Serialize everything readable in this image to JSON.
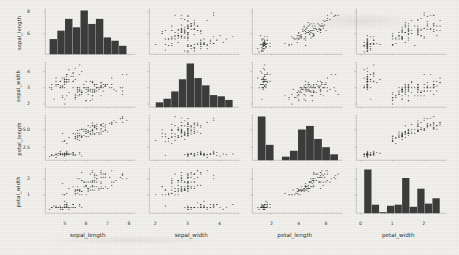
{
  "figure": {
    "kind": "scatter-plot-matrix",
    "background_color": "#f3f2ef",
    "mark_color": "#3d3d3d",
    "axis_color": "#8a8a8a"
  },
  "chart_data": {
    "type": "scatter",
    "title": "",
    "subtitle": "",
    "matrix": true,
    "grid": false,
    "legend": "none",
    "diagonal": "histogram",
    "variables": [
      "sepal_length",
      "sepal_width",
      "petal_length",
      "petal_width"
    ],
    "axis_labels": {
      "x": [
        "sepal_length",
        "sepal_width",
        "petal_length",
        "petal_width"
      ],
      "y": [
        "sepal_length",
        "sepal_width",
        "petal_length",
        "petal_width"
      ]
    },
    "x_ticks": [
      [
        "5",
        "6",
        "7",
        "8"
      ],
      [
        "2",
        "3",
        "4"
      ],
      [
        "2",
        "4",
        "6"
      ],
      [
        "0",
        "1",
        "2"
      ]
    ],
    "y_ticks": [
      [
        "8",
        "6"
      ],
      [
        "4",
        "3",
        "2"
      ],
      [
        "5.0",
        "2.5"
      ],
      [
        "2",
        "1"
      ]
    ],
    "axis_ranges": {
      "sepal_length": [
        4.1,
        8.3
      ],
      "sepal_width": [
        1.8,
        4.6
      ],
      "petal_length": [
        0.6,
        7.2
      ],
      "petal_width": [
        -0.15,
        2.7
      ]
    },
    "histograms": {
      "sepal_length": {
        "bin_edges": [
          4.3,
          4.66,
          5.02,
          5.38,
          5.74,
          6.1,
          6.46,
          6.82,
          7.18,
          7.54,
          7.9
        ],
        "counts": [
          9,
          14,
          21,
          16,
          26,
          18,
          21,
          10,
          8,
          5
        ]
      },
      "sepal_width": {
        "bin_edges": [
          2.0,
          2.24,
          2.48,
          2.72,
          2.96,
          3.2,
          3.44,
          3.68,
          3.92,
          4.16,
          4.4
        ],
        "counts": [
          4,
          7,
          13,
          23,
          36,
          24,
          18,
          10,
          9,
          6
        ]
      },
      "petal_length": {
        "bin_edges": [
          1.0,
          1.59,
          2.18,
          2.77,
          3.36,
          3.95,
          4.54,
          5.13,
          5.72,
          6.31,
          6.9
        ],
        "counts": [
          37,
          13,
          0,
          3,
          8,
          26,
          29,
          18,
          11,
          5
        ]
      },
      "petal_width": {
        "bin_edges": [
          0.1,
          0.34,
          0.58,
          0.82,
          1.06,
          1.3,
          1.54,
          1.78,
          2.02,
          2.26,
          2.5
        ],
        "counts": [
          41,
          8,
          1,
          7,
          8,
          33,
          6,
          23,
          9,
          14
        ]
      }
    },
    "series": [
      {
        "name": "iris",
        "points": [
          [
            5.1,
            3.5,
            1.4,
            0.2
          ],
          [
            4.9,
            3.0,
            1.4,
            0.2
          ],
          [
            4.7,
            3.2,
            1.3,
            0.2
          ],
          [
            4.6,
            3.1,
            1.5,
            0.2
          ],
          [
            5.0,
            3.6,
            1.4,
            0.2
          ],
          [
            5.4,
            3.9,
            1.7,
            0.4
          ],
          [
            4.6,
            3.4,
            1.4,
            0.3
          ],
          [
            5.0,
            3.4,
            1.5,
            0.2
          ],
          [
            4.4,
            2.9,
            1.4,
            0.2
          ],
          [
            4.9,
            3.1,
            1.5,
            0.1
          ],
          [
            5.4,
            3.7,
            1.5,
            0.2
          ],
          [
            4.8,
            3.4,
            1.6,
            0.2
          ],
          [
            4.8,
            3.0,
            1.4,
            0.1
          ],
          [
            4.3,
            3.0,
            1.1,
            0.1
          ],
          [
            5.8,
            4.0,
            1.2,
            0.2
          ],
          [
            5.7,
            4.4,
            1.5,
            0.4
          ],
          [
            5.4,
            3.9,
            1.3,
            0.4
          ],
          [
            5.1,
            3.5,
            1.4,
            0.3
          ],
          [
            5.7,
            3.8,
            1.7,
            0.3
          ],
          [
            5.1,
            3.8,
            1.5,
            0.3
          ],
          [
            5.4,
            3.4,
            1.7,
            0.2
          ],
          [
            5.1,
            3.7,
            1.5,
            0.4
          ],
          [
            4.6,
            3.6,
            1.0,
            0.2
          ],
          [
            5.1,
            3.3,
            1.7,
            0.5
          ],
          [
            4.8,
            3.4,
            1.9,
            0.2
          ],
          [
            5.0,
            3.0,
            1.6,
            0.2
          ],
          [
            5.0,
            3.4,
            1.6,
            0.4
          ],
          [
            5.2,
            3.5,
            1.5,
            0.2
          ],
          [
            5.2,
            3.4,
            1.4,
            0.2
          ],
          [
            4.7,
            3.2,
            1.6,
            0.2
          ],
          [
            4.8,
            3.1,
            1.6,
            0.2
          ],
          [
            5.4,
            3.4,
            1.5,
            0.4
          ],
          [
            5.2,
            4.1,
            1.5,
            0.1
          ],
          [
            5.5,
            4.2,
            1.4,
            0.2
          ],
          [
            4.9,
            3.1,
            1.5,
            0.2
          ],
          [
            5.0,
            3.2,
            1.2,
            0.2
          ],
          [
            5.5,
            3.5,
            1.3,
            0.2
          ],
          [
            4.9,
            3.6,
            1.4,
            0.1
          ],
          [
            4.4,
            3.0,
            1.3,
            0.2
          ],
          [
            5.1,
            3.4,
            1.5,
            0.2
          ],
          [
            5.0,
            3.5,
            1.3,
            0.3
          ],
          [
            4.5,
            2.3,
            1.3,
            0.3
          ],
          [
            4.4,
            3.2,
            1.3,
            0.2
          ],
          [
            5.0,
            3.5,
            1.6,
            0.6
          ],
          [
            5.1,
            3.8,
            1.9,
            0.4
          ],
          [
            4.8,
            3.0,
            1.4,
            0.3
          ],
          [
            5.1,
            3.8,
            1.6,
            0.2
          ],
          [
            4.6,
            3.2,
            1.4,
            0.2
          ],
          [
            5.3,
            3.7,
            1.5,
            0.2
          ],
          [
            5.0,
            3.3,
            1.4,
            0.2
          ],
          [
            7.0,
            3.2,
            4.7,
            1.4
          ],
          [
            6.4,
            3.2,
            4.5,
            1.5
          ],
          [
            6.9,
            3.1,
            4.9,
            1.5
          ],
          [
            5.5,
            2.3,
            4.0,
            1.3
          ],
          [
            6.5,
            2.8,
            4.6,
            1.5
          ],
          [
            5.7,
            2.8,
            4.5,
            1.3
          ],
          [
            6.3,
            3.3,
            4.7,
            1.6
          ],
          [
            4.9,
            2.4,
            3.3,
            1.0
          ],
          [
            6.6,
            2.9,
            4.6,
            1.3
          ],
          [
            5.2,
            2.7,
            3.9,
            1.4
          ],
          [
            5.0,
            2.0,
            3.5,
            1.0
          ],
          [
            5.9,
            3.0,
            4.2,
            1.5
          ],
          [
            6.0,
            2.2,
            4.0,
            1.0
          ],
          [
            6.1,
            2.9,
            4.7,
            1.4
          ],
          [
            5.6,
            2.9,
            3.6,
            1.3
          ],
          [
            6.7,
            3.1,
            4.4,
            1.4
          ],
          [
            5.6,
            3.0,
            4.5,
            1.5
          ],
          [
            5.8,
            2.7,
            4.1,
            1.0
          ],
          [
            6.2,
            2.2,
            4.5,
            1.5
          ],
          [
            5.6,
            2.5,
            3.9,
            1.1
          ],
          [
            5.9,
            3.2,
            4.8,
            1.8
          ],
          [
            6.1,
            2.8,
            4.0,
            1.3
          ],
          [
            6.3,
            2.5,
            4.9,
            1.5
          ],
          [
            6.1,
            2.8,
            4.7,
            1.2
          ],
          [
            6.4,
            2.9,
            4.3,
            1.3
          ],
          [
            6.6,
            3.0,
            4.4,
            1.4
          ],
          [
            6.8,
            2.8,
            4.8,
            1.4
          ],
          [
            6.7,
            3.0,
            5.0,
            1.7
          ],
          [
            6.0,
            2.9,
            4.5,
            1.5
          ],
          [
            5.7,
            2.6,
            3.5,
            1.0
          ],
          [
            5.5,
            2.4,
            3.8,
            1.1
          ],
          [
            5.5,
            2.4,
            3.7,
            1.0
          ],
          [
            5.8,
            2.7,
            3.9,
            1.2
          ],
          [
            6.0,
            2.7,
            5.1,
            1.6
          ],
          [
            5.4,
            3.0,
            4.5,
            1.5
          ],
          [
            6.0,
            3.4,
            4.5,
            1.6
          ],
          [
            6.7,
            3.1,
            4.7,
            1.5
          ],
          [
            6.3,
            2.3,
            4.4,
            1.3
          ],
          [
            5.6,
            3.0,
            4.1,
            1.3
          ],
          [
            5.5,
            2.5,
            4.0,
            1.3
          ],
          [
            5.5,
            2.6,
            4.4,
            1.2
          ],
          [
            6.1,
            3.0,
            4.6,
            1.4
          ],
          [
            5.8,
            2.6,
            4.0,
            1.2
          ],
          [
            5.0,
            2.3,
            3.3,
            1.0
          ],
          [
            5.6,
            2.7,
            4.2,
            1.3
          ],
          [
            5.7,
            3.0,
            4.2,
            1.2
          ],
          [
            5.7,
            2.9,
            4.2,
            1.3
          ],
          [
            6.2,
            2.9,
            4.3,
            1.3
          ],
          [
            5.1,
            2.5,
            3.0,
            1.1
          ],
          [
            5.7,
            2.8,
            4.1,
            1.3
          ],
          [
            6.3,
            3.3,
            6.0,
            2.5
          ],
          [
            5.8,
            2.7,
            5.1,
            1.9
          ],
          [
            7.1,
            3.0,
            5.9,
            2.1
          ],
          [
            6.3,
            2.9,
            5.6,
            1.8
          ],
          [
            6.5,
            3.0,
            5.8,
            2.2
          ],
          [
            7.6,
            3.0,
            6.6,
            2.1
          ],
          [
            4.9,
            2.5,
            4.5,
            1.7
          ],
          [
            7.3,
            2.9,
            6.3,
            1.8
          ],
          [
            6.7,
            2.5,
            5.8,
            1.8
          ],
          [
            7.2,
            3.6,
            6.1,
            2.5
          ],
          [
            6.5,
            3.2,
            5.1,
            2.0
          ],
          [
            6.4,
            2.7,
            5.3,
            1.9
          ],
          [
            6.8,
            3.0,
            5.5,
            2.1
          ],
          [
            5.7,
            2.5,
            5.0,
            2.0
          ],
          [
            5.8,
            2.8,
            5.1,
            2.4
          ],
          [
            6.4,
            3.2,
            5.3,
            2.3
          ],
          [
            6.5,
            3.0,
            5.5,
            1.8
          ],
          [
            7.7,
            3.8,
            6.7,
            2.2
          ],
          [
            7.7,
            2.6,
            6.9,
            2.3
          ],
          [
            6.0,
            2.2,
            5.0,
            1.5
          ],
          [
            6.9,
            3.2,
            5.7,
            2.3
          ],
          [
            5.6,
            2.8,
            4.9,
            2.0
          ],
          [
            7.7,
            2.8,
            6.7,
            2.0
          ],
          [
            6.3,
            2.7,
            4.9,
            1.8
          ],
          [
            6.7,
            3.3,
            5.7,
            2.1
          ],
          [
            7.2,
            3.2,
            6.0,
            1.8
          ],
          [
            6.2,
            2.8,
            4.8,
            1.8
          ],
          [
            6.1,
            3.0,
            4.9,
            1.8
          ],
          [
            6.4,
            2.8,
            5.6,
            2.1
          ],
          [
            7.2,
            3.0,
            5.8,
            1.6
          ],
          [
            7.4,
            2.8,
            6.1,
            1.9
          ],
          [
            7.9,
            3.8,
            6.4,
            2.0
          ],
          [
            6.4,
            2.8,
            5.6,
            2.2
          ],
          [
            6.3,
            2.8,
            5.1,
            1.5
          ],
          [
            6.1,
            2.6,
            5.6,
            1.4
          ],
          [
            7.7,
            3.0,
            6.1,
            2.3
          ],
          [
            6.3,
            3.4,
            5.6,
            2.4
          ],
          [
            6.4,
            3.1,
            5.5,
            1.8
          ],
          [
            6.0,
            3.0,
            4.8,
            1.8
          ],
          [
            6.9,
            3.1,
            5.4,
            2.1
          ],
          [
            6.7,
            3.1,
            5.6,
            2.4
          ],
          [
            6.9,
            3.1,
            5.1,
            2.3
          ],
          [
            5.8,
            2.7,
            5.1,
            1.9
          ],
          [
            6.8,
            3.2,
            5.9,
            2.3
          ],
          [
            6.7,
            3.3,
            5.7,
            2.5
          ],
          [
            6.7,
            3.0,
            5.2,
            2.3
          ],
          [
            6.3,
            2.5,
            5.0,
            1.9
          ],
          [
            6.5,
            3.0,
            5.2,
            2.0
          ],
          [
            6.2,
            3.4,
            5.4,
            2.3
          ],
          [
            5.9,
            3.0,
            5.1,
            1.8
          ]
        ]
      }
    ]
  }
}
